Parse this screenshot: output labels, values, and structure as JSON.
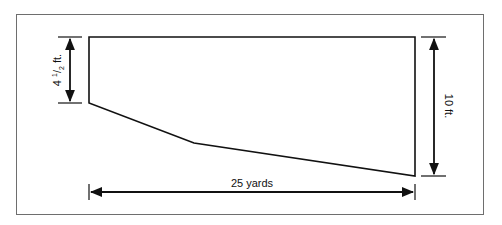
{
  "diagram": {
    "type": "pool-cross-section",
    "shape_points": [
      [
        89,
        37
      ],
      [
        415,
        37
      ],
      [
        415,
        176
      ],
      [
        194,
        143
      ],
      [
        89,
        103
      ]
    ],
    "dimensions": {
      "left_depth": {
        "whole": "4",
        "num": "1",
        "den": "2",
        "unit": "ft."
      },
      "right_depth": "10 ft.",
      "length": "25 yards"
    },
    "colors": {
      "stroke": "#111111",
      "frame": "#6e6e6e",
      "background": "#ffffff"
    }
  }
}
